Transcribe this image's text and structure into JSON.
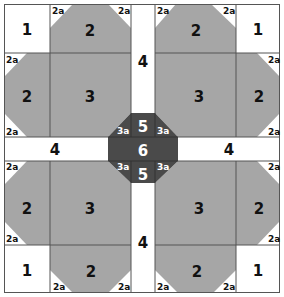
{
  "diagram": {
    "title": "",
    "colors": {
      "background": "#ffffff",
      "light_gray": "#a6a6a6",
      "dark_gray": "#4a4a4a",
      "line": "#555555"
    },
    "labels": {
      "corner_square": "1",
      "side_piece": "2",
      "corner_triangle": "2a",
      "center_block": "3",
      "strip": "4",
      "octagon_half": "5",
      "octagon_center": "6",
      "octagon_triangle": "3a"
    },
    "quadrants": [
      {
        "name": "top-left",
        "corner": "1",
        "sides": [
          "2",
          "2"
        ],
        "center": "3",
        "triangles": [
          "2a",
          "2a",
          "2a",
          "2a"
        ]
      },
      {
        "name": "top-right",
        "corner": "1",
        "sides": [
          "2",
          "2"
        ],
        "center": "3",
        "triangles": [
          "2a",
          "2a",
          "2a",
          "2a"
        ]
      },
      {
        "name": "bottom-left",
        "corner": "1",
        "sides": [
          "2",
          "2"
        ],
        "center": "3",
        "triangles": [
          "2a",
          "2a",
          "2a",
          "2a"
        ]
      },
      {
        "name": "bottom-right",
        "corner": "1",
        "sides": [
          "2",
          "2"
        ],
        "center": "3",
        "triangles": [
          "2a",
          "2a",
          "2a",
          "2a"
        ]
      }
    ],
    "strips": [
      "4",
      "4",
      "4",
      "4"
    ],
    "center_octagon": {
      "top": "5",
      "middle": "6",
      "bottom": "5",
      "triangles": [
        "3a",
        "3a",
        "3a",
        "3a"
      ]
    }
  }
}
